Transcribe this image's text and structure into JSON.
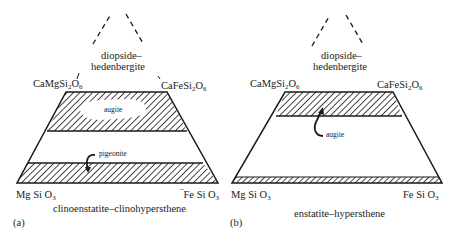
{
  "colors": {
    "ink": "#1a1a1a",
    "background": "#ffffff"
  },
  "panels": [
    {
      "id": "a",
      "panel_label": "(a)",
      "apex_label_line1": "diopside–",
      "apex_label_line2": "hedenbergite",
      "top_left": {
        "formula": "CaMgSi",
        "sub1": "2",
        "mid": "O",
        "sub2": "6"
      },
      "top_right": {
        "formula": "CaFeSi",
        "sub1": "2",
        "mid": "O",
        "sub2": "6"
      },
      "bottom_left": {
        "formula": "Mg Si O",
        "sub": "3"
      },
      "bottom_right": {
        "formula": "Fe Si O",
        "sub": "3"
      },
      "series_label": "clinoenstatite–clinohypersthene",
      "field_labels": {
        "upper": "augite",
        "lower": "pigeonite"
      }
    },
    {
      "id": "b",
      "panel_label": "(b)",
      "apex_label_line1": "diopside–",
      "apex_label_line2": "hedenbergite",
      "top_left": {
        "formula": "CaMgSi",
        "sub1": "2",
        "mid": "O",
        "sub2": "6"
      },
      "top_right": {
        "formula": "CaFeSi",
        "sub1": "2",
        "mid": "O",
        "sub2": "6"
      },
      "bottom_left": {
        "formula": "Mg Si O",
        "sub": "3"
      },
      "bottom_right": {
        "formula": "Fe Si O",
        "sub": "3"
      },
      "series_label": "enstatite–hypersthene",
      "field_labels": {
        "upper": "augite"
      }
    }
  ]
}
